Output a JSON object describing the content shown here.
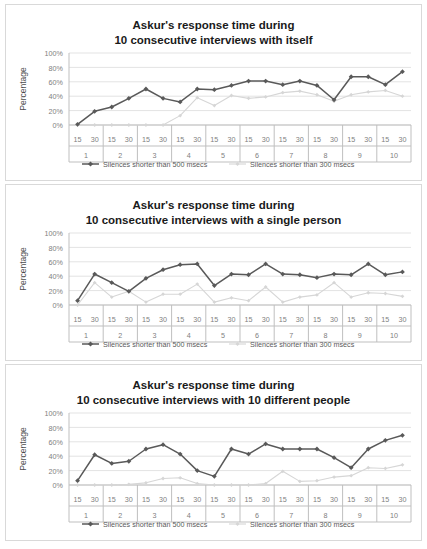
{
  "figure": {
    "axis_label": "Percentage",
    "y_ticks": [
      "0%",
      "20%",
      "40%",
      "60%",
      "80%",
      "100%"
    ],
    "y_values": [
      0,
      20,
      40,
      60,
      80,
      100
    ],
    "sub_tick_labels": [
      "15",
      "30"
    ],
    "group_labels": [
      "1",
      "2",
      "3",
      "4",
      "5",
      "6",
      "7",
      "8",
      "9",
      "10"
    ],
    "legend": [
      {
        "label": "Silences shorter than 500 msecs",
        "color": "#595959",
        "marker": "diamond"
      },
      {
        "label": "Silences shorter than 300 msecs",
        "color": "#d6d6d6",
        "marker": "diamond"
      }
    ],
    "colors": {
      "series_500": "#595959",
      "series_300": "#d6d6d6",
      "gridline": "#e3e3e3",
      "axis": "#bfbfbf",
      "tick_text": "#808080",
      "title_text": "#1a1a1a",
      "card_border": "#d9d9d9",
      "background": "#ffffff"
    }
  },
  "chart_data": [
    {
      "type": "line",
      "title": "Askur's response time during\n10 consecutive interviews with itself",
      "title_line1": "Askur's response time during",
      "title_line2": "10 consecutive interviews with itself",
      "xlabel": "",
      "ylabel": "Percentage",
      "ylim": [
        0,
        100
      ],
      "grid": true,
      "legend_position": "bottom",
      "categories": [
        "15",
        "30",
        "15",
        "30",
        "15",
        "30",
        "15",
        "30",
        "15",
        "30",
        "15",
        "30",
        "15",
        "30",
        "15",
        "30",
        "15",
        "30",
        "15",
        "30"
      ],
      "groups": [
        "1",
        "2",
        "3",
        "4",
        "5",
        "6",
        "7",
        "8",
        "9",
        "10"
      ],
      "series": [
        {
          "name": "Silences shorter than 500 msecs",
          "values": [
            1,
            19,
            25,
            37,
            50,
            37,
            32,
            50,
            49,
            55,
            61,
            61,
            56,
            61,
            55,
            35,
            67,
            67,
            56,
            74
          ]
        },
        {
          "name": "Silences shorter than 300 msecs",
          "values": [
            0,
            0,
            0,
            0,
            0,
            0,
            13,
            38,
            27,
            41,
            37,
            39,
            45,
            47,
            42,
            33,
            42,
            46,
            48,
            40
          ]
        }
      ]
    },
    {
      "type": "line",
      "title": "Askur's response time during\n10 consecutive interviews with a single person",
      "title_line1": "Askur's response time during",
      "title_line2": "10 consecutive interviews with a single person",
      "xlabel": "",
      "ylabel": "Percentage",
      "ylim": [
        0,
        100
      ],
      "grid": true,
      "legend_position": "bottom",
      "categories": [
        "15",
        "30",
        "15",
        "30",
        "15",
        "30",
        "15",
        "30",
        "15",
        "30",
        "15",
        "30",
        "15",
        "30",
        "15",
        "30",
        "15",
        "30",
        "15",
        "30"
      ],
      "groups": [
        "1",
        "2",
        "3",
        "4",
        "5",
        "6",
        "7",
        "8",
        "9",
        "10"
      ],
      "series": [
        {
          "name": "Silences shorter than 500 msecs",
          "values": [
            6,
            43,
            31,
            19,
            37,
            49,
            56,
            57,
            27,
            43,
            42,
            57,
            43,
            42,
            38,
            43,
            42,
            57,
            42,
            46
          ]
        },
        {
          "name": "Silences shorter than 300 msecs",
          "values": [
            0,
            31,
            11,
            19,
            4,
            15,
            15,
            29,
            4,
            10,
            6,
            25,
            4,
            11,
            14,
            31,
            11,
            17,
            16,
            12
          ]
        }
      ]
    },
    {
      "type": "line",
      "title": "Askur's response time during\n10 consecutive interviews with 10 different people",
      "title_line1": "Askur's response time during",
      "title_line2": "10 consecutive interviews with 10 different people",
      "xlabel": "",
      "ylabel": "Percentage",
      "ylim": [
        0,
        100
      ],
      "grid": true,
      "legend_position": "bottom",
      "categories": [
        "15",
        "30",
        "15",
        "30",
        "15",
        "30",
        "15",
        "30",
        "15",
        "30",
        "15",
        "30",
        "15",
        "30",
        "15",
        "30",
        "15",
        "30",
        "15",
        "30"
      ],
      "groups": [
        "1",
        "2",
        "3",
        "4",
        "5",
        "6",
        "7",
        "8",
        "9",
        "10"
      ],
      "series": [
        {
          "name": "Silences shorter than 500 msecs",
          "values": [
            6,
            42,
            30,
            33,
            50,
            56,
            43,
            20,
            12,
            50,
            43,
            57,
            50,
            50,
            50,
            38,
            24,
            50,
            62,
            69
          ]
        },
        {
          "name": "Silences shorter than 300 msecs",
          "values": [
            0,
            0,
            0,
            1,
            3,
            9,
            10,
            2,
            0,
            0,
            0,
            2,
            19,
            5,
            6,
            11,
            13,
            24,
            23,
            28
          ]
        }
      ]
    }
  ]
}
